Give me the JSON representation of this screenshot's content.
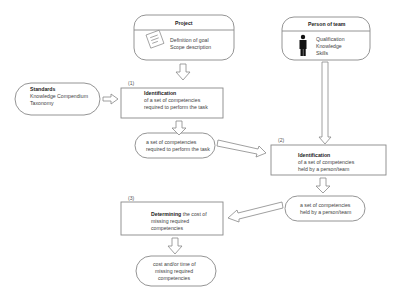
{
  "project": {
    "title": "Project",
    "lines": [
      "Definition of goal",
      "Scope description"
    ],
    "icon": "clipboard-icon"
  },
  "person": {
    "title": "Person of team",
    "lines": [
      "Qualification",
      "Knowledge",
      "Skills"
    ],
    "icon": "person-icon"
  },
  "standards": {
    "title": "Standards",
    "lines": [
      "Knowledge Compendium",
      "Taxonomy"
    ]
  },
  "step1": {
    "number": "(1)",
    "title": "Identification",
    "lines": [
      "of a set of competencies",
      "required to perform the task"
    ]
  },
  "result1": {
    "lines": [
      "a set of competencies",
      "required to perform the task"
    ]
  },
  "step2": {
    "number": "(2)",
    "title": "Identification",
    "lines": [
      "of a set of competencies",
      "held by a person/team"
    ]
  },
  "result2": {
    "lines": [
      "a set of competencies",
      "held by a person/team"
    ]
  },
  "step3": {
    "number": "(3)",
    "title_bold": "Determining",
    "title_rest": " the cost of",
    "lines": [
      "missing required",
      "competencies"
    ]
  },
  "result3": {
    "lines": [
      "cost and/or time of",
      "missing required",
      "competencies"
    ]
  },
  "colors": {
    "stroke": "#888888",
    "text": "#444444",
    "background": "#ffffff"
  }
}
